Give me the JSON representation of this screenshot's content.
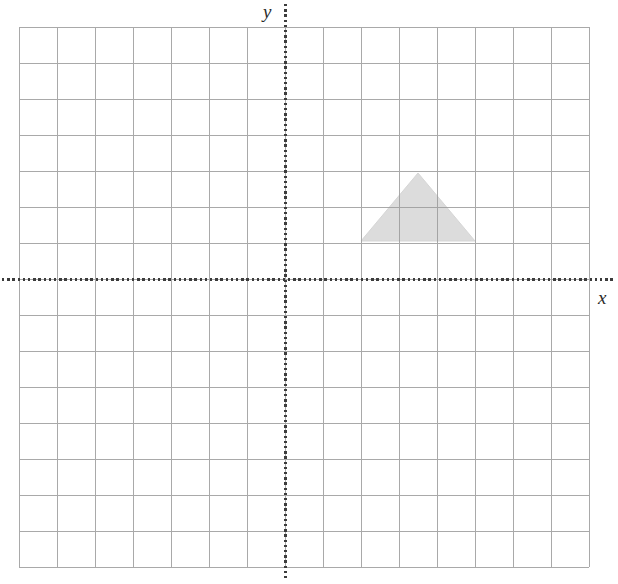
{
  "figure": {
    "width": 618,
    "height": 584,
    "background_color": "#ffffff"
  },
  "labels": {
    "y_axis": "y",
    "x_axis": "x"
  },
  "colors": {
    "grid_line": "#9b9b9b",
    "grid_line_light": "#b4b4b4",
    "axis_line": "#3c3c3c",
    "shape_fill": "#dcdcdc",
    "shape_stroke": "#d2d2d2",
    "label_text": "#2b2b2b"
  },
  "chart_data": {
    "type": "scatter",
    "title": "",
    "xlabel": "x",
    "ylabel": "y",
    "grid": true,
    "legend": false,
    "axis_style": "dotted",
    "origin_px": {
      "x": 285,
      "y": 279
    },
    "cell_size_px": {
      "width": 38,
      "height": 36
    },
    "grid_bounds_px": {
      "left": 19,
      "top": 27,
      "right": 589,
      "bottom": 567
    },
    "grid_counts": {
      "columns": 15,
      "rows": 15
    },
    "xlim": [
      -7,
      8
    ],
    "ylim": [
      -8,
      7
    ],
    "xticks": [
      -7,
      -6,
      -5,
      -4,
      -3,
      -2,
      -1,
      0,
      1,
      2,
      3,
      4,
      5,
      6,
      7,
      8
    ],
    "yticks": [
      -8,
      -7,
      -6,
      -5,
      -4,
      -3,
      -2,
      -1,
      0,
      1,
      2,
      3,
      4,
      5,
      6,
      7
    ],
    "tick_labels_visible": false,
    "shapes": [
      {
        "name": "triangle",
        "kind": "polygon",
        "fill": "#dcdcdc",
        "vertices_units": [
          [
            2,
            1
          ],
          [
            5,
            1
          ],
          [
            3.5,
            2.9
          ]
        ],
        "vertices_px": [
          [
            361,
            241
          ],
          [
            475,
            241
          ],
          [
            418,
            173
          ]
        ]
      }
    ]
  }
}
